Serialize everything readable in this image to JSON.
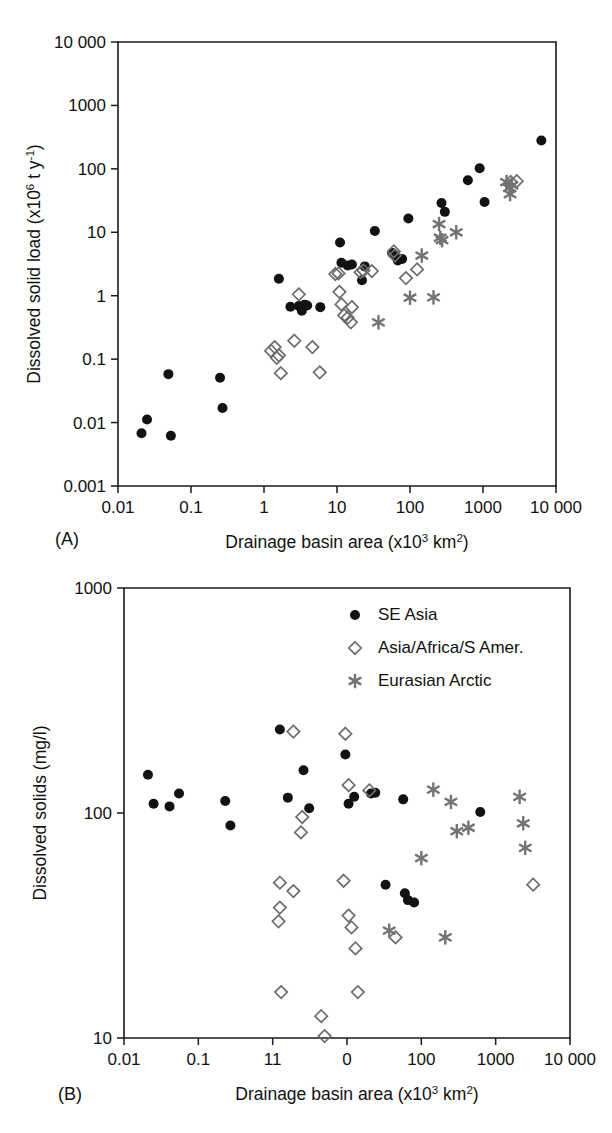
{
  "figure": {
    "panels": [
      {
        "id": "A",
        "label": "(A)",
        "xlabel_main": "Drainage basin area (x10",
        "xlabel_sup1": "3",
        "xlabel_mid": " km",
        "xlabel_sup2": "2",
        "xlabel_end": ")",
        "ylabel_main": "Dissolved solid load (x10",
        "ylabel_sup1": "6",
        "ylabel_mid": " t y",
        "ylabel_sup2": "-1",
        "ylabel_end": ")"
      },
      {
        "id": "B",
        "label": "(B)",
        "xlabel_main": "Drainage basin area (x10",
        "xlabel_sup1": "3",
        "xlabel_mid": " km",
        "xlabel_sup2": "2",
        "xlabel_end": ")",
        "ylabel_main": "Dissolved solids (mg/l)"
      }
    ],
    "legend": {
      "position": "top-right of panel B",
      "items": [
        {
          "marker": "filled-circle",
          "label": "SE Asia",
          "color": "#121212"
        },
        {
          "marker": "open-diamond",
          "label": "Asia/Africa/S Amer.",
          "color": "#6d6d6d"
        },
        {
          "marker": "six-point-star",
          "label": "Eurasian Arctic",
          "color": "#737373"
        }
      ]
    }
  },
  "chart_data": [
    {
      "type": "scatter",
      "panel": "A",
      "title": "",
      "xlabel": "Drainage basin area (x10^3 km^2)",
      "ylabel": "Dissolved solid load (x10^6 t y^-1)",
      "xscale": "log",
      "yscale": "log",
      "xlim": [
        0.01,
        10000
      ],
      "ylim": [
        0.001,
        10000
      ],
      "xticks": [
        0.01,
        0.1,
        1,
        10,
        100,
        1000,
        10000
      ],
      "xticklabels": [
        "0.01",
        "0.1",
        "1",
        "10",
        "100",
        "1000",
        "10 000"
      ],
      "yticks": [
        0.001,
        0.01,
        0.1,
        1,
        10,
        100,
        1000,
        10000
      ],
      "yticklabels": [
        "0.001",
        "0.01",
        "0.1",
        "1",
        "10",
        "100",
        "1000",
        "10 000"
      ],
      "grid": false,
      "legend": false,
      "series": [
        {
          "name": "SE Asia",
          "marker": "filled-circle",
          "color": "#121212",
          "points": [
            [
              0.021,
              0.0068
            ],
            [
              0.025,
              0.0112
            ],
            [
              0.053,
              0.0062
            ],
            [
              0.049,
              0.058
            ],
            [
              0.25,
              0.051
            ],
            [
              0.27,
              0.017
            ],
            [
              1.6,
              1.85
            ],
            [
              2.3,
              0.67
            ],
            [
              3.0,
              0.69
            ],
            [
              3.3,
              0.58
            ],
            [
              3.6,
              0.72
            ],
            [
              3.9,
              0.7
            ],
            [
              5.9,
              0.66
            ],
            [
              11,
              6.9
            ],
            [
              11.5,
              3.3
            ],
            [
              14,
              3.0
            ],
            [
              16,
              3.1
            ],
            [
              22,
              1.75
            ],
            [
              24,
              2.9
            ],
            [
              33,
              10.5
            ],
            [
              57,
              4.7
            ],
            [
              62,
              4.4
            ],
            [
              68,
              3.6
            ],
            [
              78,
              3.8
            ],
            [
              95,
              16.5
            ],
            [
              270,
              29
            ],
            [
              300,
              21
            ],
            [
              620,
              66
            ],
            [
              900,
              102
            ],
            [
              1050,
              30
            ],
            [
              6300,
              280
            ]
          ]
        },
        {
          "name": "Asia/Africa/S Amer.",
          "marker": "open-diamond",
          "color": "#6d6d6d",
          "points": [
            [
              1.25,
              0.135
            ],
            [
              1.4,
              0.155
            ],
            [
              1.5,
              0.105
            ],
            [
              1.6,
              0.115
            ],
            [
              1.7,
              0.06
            ],
            [
              2.6,
              0.195
            ],
            [
              3.0,
              1.05
            ],
            [
              4.6,
              0.155
            ],
            [
              5.8,
              0.062
            ],
            [
              9.5,
              2.2
            ],
            [
              10.5,
              2.25
            ],
            [
              10.8,
              1.15
            ],
            [
              11.5,
              0.73
            ],
            [
              12.5,
              0.49
            ],
            [
              14,
              0.45
            ],
            [
              15.5,
              0.38
            ],
            [
              16,
              0.66
            ],
            [
              21,
              2.35
            ],
            [
              23,
              2.5
            ],
            [
              30,
              2.45
            ],
            [
              60,
              5.0
            ],
            [
              62,
              4.3
            ],
            [
              88,
              1.9
            ],
            [
              125,
              2.6
            ],
            [
              2400,
              62
            ],
            [
              2900,
              64
            ]
          ]
        },
        {
          "name": "Eurasian Arctic",
          "marker": "six-point-star",
          "color": "#737373",
          "points": [
            [
              37,
              0.38
            ],
            [
              100,
              0.93
            ],
            [
              210,
              0.94
            ],
            [
              145,
              4.3
            ],
            [
              250,
              13.5
            ],
            [
              260,
              8.2
            ],
            [
              275,
              7.5
            ],
            [
              430,
              10.0
            ],
            [
              2100,
              62
            ],
            [
              2300,
              50
            ],
            [
              2350,
              40
            ],
            [
              2500,
              55
            ]
          ]
        }
      ]
    },
    {
      "type": "scatter",
      "panel": "B",
      "title": "",
      "xlabel": "Drainage basin area (x10^3 km^2)",
      "ylabel": "Dissolved solids (mg/l)",
      "xscale": "log",
      "yscale": "log",
      "xlim": [
        0.01,
        10000
      ],
      "ylim": [
        10,
        1000
      ],
      "xticks": [
        0.01,
        0.1,
        1,
        10,
        100,
        1000,
        10000
      ],
      "xticklabels": [
        "0.01",
        "0.1",
        "11",
        "0",
        "100",
        "1000",
        "10 000"
      ],
      "yticks": [
        10,
        100,
        1000
      ],
      "yticklabels": [
        "10",
        "100",
        "1000"
      ],
      "grid": false,
      "legend": true,
      "series": [
        {
          "name": "SE Asia",
          "marker": "filled-circle",
          "color": "#121212",
          "points": [
            [
              0.021,
              148
            ],
            [
              0.025,
              110
            ],
            [
              0.041,
              107
            ],
            [
              0.055,
              122
            ],
            [
              0.23,
              113
            ],
            [
              0.27,
              88
            ],
            [
              1.25,
              235
            ],
            [
              1.6,
              117
            ],
            [
              2.6,
              155
            ],
            [
              3.1,
              105
            ],
            [
              9.5,
              182
            ],
            [
              10.5,
              110
            ],
            [
              12.5,
              118
            ],
            [
              21,
              122
            ],
            [
              24,
              123
            ],
            [
              57,
              115
            ],
            [
              33,
              48
            ],
            [
              60,
              44
            ],
            [
              66,
              41
            ],
            [
              80,
              40
            ],
            [
              620,
              101
            ]
          ]
        },
        {
          "name": "Asia/Africa/S Amer.",
          "marker": "open-diamond",
          "color": "#6d6d6d",
          "points": [
            [
              1.9,
              230
            ],
            [
              9.5,
              225
            ],
            [
              10.5,
              133
            ],
            [
              20,
              126
            ],
            [
              2.5,
              96
            ],
            [
              2.4,
              82
            ],
            [
              1.25,
              49
            ],
            [
              1.9,
              45
            ],
            [
              1.25,
              38
            ],
            [
              1.2,
              33
            ],
            [
              9.0,
              50
            ],
            [
              10.5,
              35
            ],
            [
              11.5,
              31
            ],
            [
              13,
              25
            ],
            [
              45,
              28
            ],
            [
              1.3,
              16
            ],
            [
              14,
              16
            ],
            [
              4.5,
              12.5
            ],
            [
              5.0,
              10.2
            ],
            [
              3200,
              48
            ]
          ]
        },
        {
          "name": "Eurasian Arctic",
          "marker": "six-point-star",
          "color": "#737373",
          "points": [
            [
              145,
              127
            ],
            [
              250,
              112
            ],
            [
              300,
              83
            ],
            [
              430,
              86
            ],
            [
              100,
              63
            ],
            [
              2100,
              118
            ],
            [
              2350,
              90
            ],
            [
              2500,
              70
            ],
            [
              37,
              30
            ],
            [
              210,
              28
            ]
          ]
        }
      ]
    }
  ]
}
